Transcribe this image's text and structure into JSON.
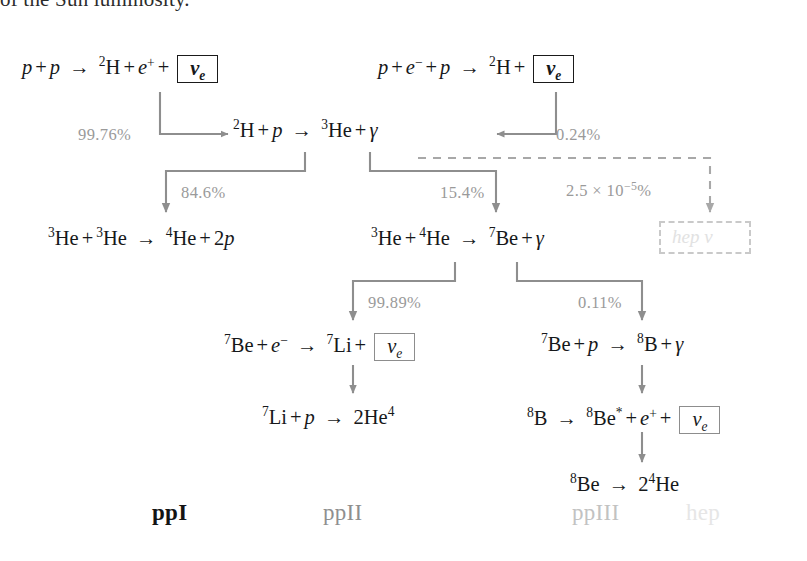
{
  "figure": {
    "title_fragment": "of the Sun luminosity.",
    "type": "pp-chain-nuclear-reaction-diagram",
    "colors": {
      "text": "#16181a",
      "connector": "#8e8e8e",
      "percent_label": "#9a9a9a",
      "faded_hep": "#e2e2e2",
      "ppI": "#141414",
      "ppII": "#8f8f8f",
      "ppIII": "#c2c2c2",
      "hep": "#e6e6e6"
    }
  },
  "reactions": {
    "pp": {
      "id": "pp-reaction",
      "text": "p + p → 2H + e+ + νe",
      "lhs": "p + p",
      "arrow": "→",
      "rhs": "2H + e+ +",
      "neutrino": "νe"
    },
    "pep": {
      "id": "pep-reaction",
      "text": "p + e− + p → 2H+ νe",
      "lhs": "p + e− + p",
      "arrow": "→",
      "rhs": "2H+",
      "neutrino": "νe"
    },
    "deuterium": {
      "id": "deuterium-burning",
      "text": "2H + p → 3He + γ"
    },
    "ppI": {
      "id": "ppI-termination",
      "text": "3He + 3He → 4He + 2p"
    },
    "he3he4": {
      "id": "he3-he4-fusion",
      "text": "3He + 4He → 7Be + γ"
    },
    "be7_electron": {
      "id": "be7-electron-capture",
      "text": "7Be + e− → 7Li+ νe",
      "neutrino": "νe"
    },
    "li7": {
      "id": "li7-proton-capture",
      "text": "7Li + p → 2He4"
    },
    "be7_proton": {
      "id": "be7-proton-capture",
      "text": "7Be + p → 8B + γ"
    },
    "b8_decay": {
      "id": "b8-beta-decay",
      "text": "8B → 8Be* + e+ + νe",
      "neutrino": "νe"
    },
    "be8_decay": {
      "id": "be8-breakup",
      "text": "8Be → 2 4He"
    },
    "hep_neutrino": {
      "id": "hep-neutrino-box",
      "text": "hep ν"
    }
  },
  "branching": {
    "pp_branch": "99.76%",
    "pep_branch": "0.24%",
    "ppI_branch": "84.6%",
    "ppII_ppIII_branch": "15.4%",
    "be7_electron_branch": "99.89%",
    "be7_proton_branch": "0.11%",
    "hep_branch_coeff": "2.5 × 10",
    "hep_branch_exp": "−5",
    "hep_branch_suffix": "%"
  },
  "chain_labels": {
    "ppI": "ppI",
    "ppII": "ppII",
    "ppIII": "ppIII",
    "hep": "hep"
  }
}
